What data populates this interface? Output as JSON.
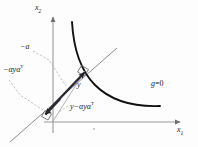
{
  "figure": {
    "kind": "geometry-diagram",
    "background": "#fdfdfd",
    "axes": {
      "x_axis_label": "x",
      "x_axis_sub": "1",
      "y_axis_label": "x",
      "y_axis_sub": "2",
      "axis_color": "#9a9a9a",
      "origin_tick": "o"
    },
    "curve": {
      "label": "g",
      "label_eq": "=0",
      "color": "#111111"
    },
    "labels": {
      "neg_a": "−a",
      "neg_alpha_y_alpha": "−αyα",
      "neg_alpha_y_alpha_sup": "T",
      "y_minus": "y−αyα",
      "y_minus_sup": "T",
      "y_vec": "y"
    },
    "colors": {
      "curve": "#111111",
      "tangent_line": "#8d8d93",
      "vector": "#2b2b33",
      "leader": "#a7a7ad",
      "axis": "#9a9a9a",
      "text": "#1c1c1c"
    }
  }
}
